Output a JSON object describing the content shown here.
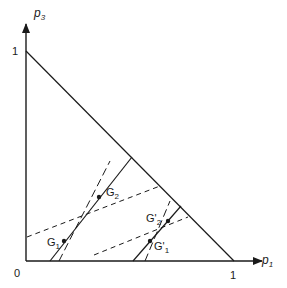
{
  "diagram": {
    "type": "simplex-probability-triangle",
    "axes": {
      "x": {
        "label": "p",
        "subscript": "1",
        "tick_label": "1"
      },
      "y": {
        "label": "p",
        "subscript": "3",
        "tick_label": "1"
      },
      "origin_label": "0"
    },
    "points": [
      {
        "name": "G",
        "sub": "1",
        "prime": ""
      },
      {
        "name": "G",
        "sub": "2",
        "prime": ""
      },
      {
        "name": "G",
        "sub": "1",
        "prime": "'"
      },
      {
        "name": "G",
        "sub": "2",
        "prime": "'"
      }
    ],
    "colors": {
      "ink": "#1a1a1a",
      "background": "#ffffff"
    }
  }
}
